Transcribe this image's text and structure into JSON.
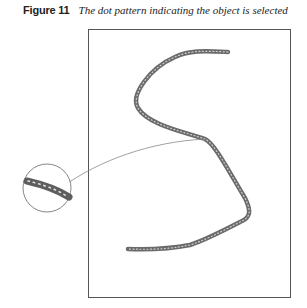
{
  "figure": {
    "label": "Figure 11",
    "caption": "The dot pattern indicating the object is selected"
  },
  "colors": {
    "stroke": "#6b6b6b",
    "dots": "#cfcfcf",
    "frame": "#555555",
    "callout": "#888888"
  }
}
